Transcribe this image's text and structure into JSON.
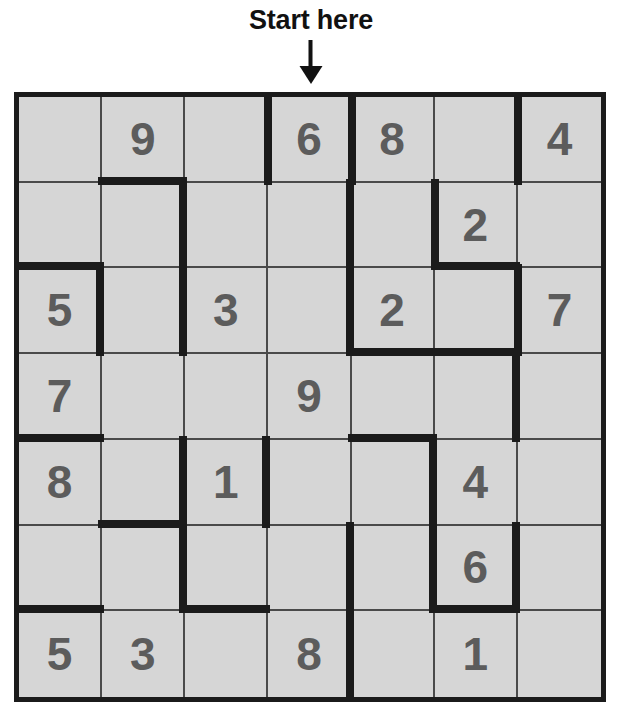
{
  "annotation": {
    "start_label": "Start here",
    "arrow_icon": "arrow-down-icon",
    "arrow_target_column": 4
  },
  "colors": {
    "cell_background": "#d6d6d6",
    "digit": "#5c5c5c",
    "thin_border": "#4a4a4a",
    "thick_border": "#1b1b1b",
    "label_text": "#111111",
    "page_background": "#ffffff"
  },
  "grid": {
    "rows": 7,
    "columns": 7,
    "cells": [
      [
        {
          "value": "",
          "walls": []
        },
        {
          "value": "9",
          "walls": [
            "bottom"
          ]
        },
        {
          "value": "",
          "walls": []
        },
        {
          "value": "6",
          "walls": [
            "left"
          ]
        },
        {
          "value": "8",
          "walls": [
            "left"
          ]
        },
        {
          "value": "",
          "walls": []
        },
        {
          "value": "4",
          "walls": [
            "left"
          ]
        }
      ],
      [
        {
          "value": "",
          "walls": [
            "bottom"
          ]
        },
        {
          "value": "",
          "walls": [
            "right"
          ]
        },
        {
          "value": "",
          "walls": []
        },
        {
          "value": "",
          "walls": [
            "right"
          ]
        },
        {
          "value": "",
          "walls": []
        },
        {
          "value": "2",
          "walls": [
            "left",
            "bottom"
          ]
        },
        {
          "value": "",
          "walls": []
        }
      ],
      [
        {
          "value": "5",
          "walls": [
            "right"
          ]
        },
        {
          "value": "",
          "walls": [
            "right"
          ]
        },
        {
          "value": "3",
          "walls": []
        },
        {
          "value": "",
          "walls": [
            "right"
          ]
        },
        {
          "value": "2",
          "walls": [
            "bottom"
          ]
        },
        {
          "value": "",
          "walls": [
            "bottom"
          ]
        },
        {
          "value": "7",
          "walls": [
            "left"
          ]
        }
      ],
      [
        {
          "value": "7",
          "walls": [
            "bottom"
          ]
        },
        {
          "value": "",
          "walls": []
        },
        {
          "value": "",
          "walls": []
        },
        {
          "value": "9",
          "walls": []
        },
        {
          "value": "",
          "walls": [
            "bottom"
          ]
        },
        {
          "value": "",
          "walls": [
            "right"
          ]
        },
        {
          "value": "",
          "walls": []
        }
      ],
      [
        {
          "value": "8",
          "walls": []
        },
        {
          "value": "",
          "walls": [
            "right",
            "bottom"
          ]
        },
        {
          "value": "1",
          "walls": [
            "right"
          ]
        },
        {
          "value": "",
          "walls": []
        },
        {
          "value": "",
          "walls": [
            "right"
          ]
        },
        {
          "value": "4",
          "walls": []
        },
        {
          "value": "",
          "walls": []
        }
      ],
      [
        {
          "value": "",
          "walls": [
            "bottom"
          ]
        },
        {
          "value": "",
          "walls": [
            "right"
          ]
        },
        {
          "value": "",
          "walls": [
            "bottom"
          ]
        },
        {
          "value": "",
          "walls": [
            "right"
          ]
        },
        {
          "value": "",
          "walls": [
            "right"
          ]
        },
        {
          "value": "6",
          "walls": [
            "right",
            "bottom"
          ]
        },
        {
          "value": "",
          "walls": []
        }
      ],
      [
        {
          "value": "5",
          "walls": []
        },
        {
          "value": "3",
          "walls": []
        },
        {
          "value": "",
          "walls": []
        },
        {
          "value": "8",
          "walls": [
            "right"
          ]
        },
        {
          "value": "",
          "walls": []
        },
        {
          "value": "1",
          "walls": []
        },
        {
          "value": "",
          "walls": []
        }
      ]
    ]
  }
}
